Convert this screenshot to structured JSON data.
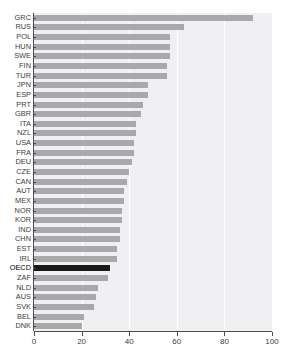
{
  "chart_data": {
    "type": "bar",
    "orientation": "horizontal",
    "title": "",
    "xlabel": "",
    "ylabel": "",
    "xlim": [
      0,
      100
    ],
    "xticks": [
      0,
      20,
      40,
      60,
      80,
      100
    ],
    "grid": true,
    "legend": null,
    "highlight_category": "OECD",
    "colors": {
      "bar": "#a9a9ac",
      "highlight_bar": "#1a1a1a",
      "panel": "#f0f0f2",
      "gridline": "#ffffff",
      "axis": "#4d4d4d",
      "text": "#3c3c3c"
    },
    "categories": [
      "GRC",
      "RUS",
      "POL",
      "HUN",
      "SWE",
      "FIN",
      "TUR",
      "JPN",
      "ESP",
      "PRT",
      "GBR",
      "ITA",
      "NZL",
      "USA",
      "FRA",
      "DEU",
      "CZE",
      "CAN",
      "AUT",
      "MEX",
      "NOR",
      "KOR",
      "IND",
      "CHN",
      "EST",
      "IRL",
      "OECD",
      "ZAF",
      "NLD",
      "AUS",
      "SVK",
      "BEL",
      "DNK"
    ],
    "values": [
      92,
      63,
      57,
      57,
      57,
      56,
      56,
      48,
      48,
      46,
      45,
      43,
      43,
      42,
      42,
      41,
      40,
      39,
      38,
      38,
      37,
      37,
      36,
      36,
      35,
      35,
      32,
      31,
      27,
      26,
      25,
      21,
      20
    ]
  }
}
